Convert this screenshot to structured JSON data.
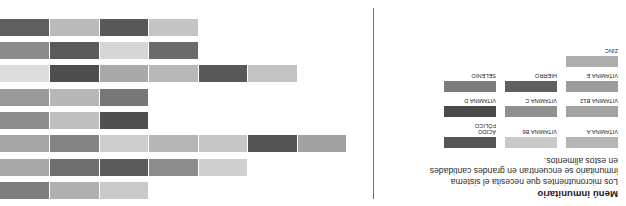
{
  "header": {
    "title": "Menú inmunitario",
    "description": "Los micronutrientes que necesita el sistema inmunitario se encuentran en grandes cantidades en estos alimentos."
  },
  "legend": {
    "rows": [
      [
        {
          "label": "VITAMINA A",
          "color": "#b5b5b5"
        },
        {
          "label": "VITAMINA B6",
          "color": "#c9c9c9"
        },
        {
          "label": "ÁCIDO\nFÓLICO",
          "color": "#555555"
        }
      ],
      [
        {
          "label": "VITAMINA B12",
          "color": "#a3a3a3"
        },
        {
          "label": "VITAMINA C",
          "color": "#8f8f8f"
        },
        {
          "label": "VITAMINA D",
          "color": "#4a4a4a"
        }
      ],
      [
        {
          "label": "VITAMINA E",
          "color": "#9c9c9c"
        },
        {
          "label": "HIERRO",
          "color": "#5f5f5f"
        },
        {
          "label": "SELENIO",
          "color": "#7c7c7c"
        }
      ],
      [
        {
          "label": "ZINC",
          "color": "#adadad"
        }
      ]
    ]
  },
  "chart_data": {
    "type": "bar",
    "orientation": "horizontal-stacked",
    "title": "Menú inmunitario",
    "xlabel": "",
    "ylabel": "",
    "grid": false,
    "legend_position": "left",
    "categories": [
      "ZANAHORIAS",
      "CEREALES",
      "HUEVOS",
      "CÍTRICOS",
      "MARISCOS",
      "AVES",
      "PIMIENTOS",
      "BRÓCOLI"
    ],
    "nutrients": [
      "VITAMINA A",
      "VITAMINA B6",
      "ÁCIDO FÓLICO",
      "VITAMINA B12",
      "VITAMINA C",
      "VITAMINA D",
      "VITAMINA E",
      "HIERRO",
      "SELENIO",
      "ZINC"
    ],
    "series": [
      {
        "category": "ZANAHORIAS",
        "segments": [
          {
            "nutrient": "VITAMINA A",
            "value": 1,
            "color": "#c9c9c9"
          },
          {
            "nutrient": "VITAMINA B6",
            "value": 1,
            "color": "#b0b0b0"
          },
          {
            "nutrient": "VITAMINA E",
            "value": 1,
            "color": "#7e7e7e"
          }
        ]
      },
      {
        "category": "CEREALES",
        "segments": [
          {
            "nutrient": "VITAMINA A",
            "value": 1,
            "color": "#cfcfcf"
          },
          {
            "nutrient": "VITAMINA B6",
            "value": 1,
            "color": "#8c8c8c"
          },
          {
            "nutrient": "ÁCIDO FÓLICO",
            "value": 1,
            "color": "#5c5c5c"
          },
          {
            "nutrient": "HIERRO",
            "value": 1,
            "color": "#6e6e6e"
          },
          {
            "nutrient": "SELENIO",
            "value": 1,
            "color": "#a8a8a8"
          }
        ]
      },
      {
        "category": "HUEVOS",
        "segments": [
          {
            "nutrient": "VITAMINA A",
            "value": 1,
            "color": "#a2a2a2"
          },
          {
            "nutrient": "VITAMINA B12",
            "value": 1,
            "color": "#545454"
          },
          {
            "nutrient": "ÁCIDO FÓLICO",
            "value": 1,
            "color": "#c6c6c6"
          },
          {
            "nutrient": "VITAMINA D",
            "value": 1,
            "color": "#b6b6b6"
          },
          {
            "nutrient": "VITAMINA E",
            "value": 1,
            "color": "#cdcdcd"
          },
          {
            "nutrient": "HIERRO",
            "value": 1,
            "color": "#848484"
          },
          {
            "nutrient": "SELENIO",
            "value": 1,
            "color": "#a5a5a5"
          }
        ]
      },
      {
        "category": "CÍTRICOS",
        "segments": [
          {
            "nutrient": "VITAMINA C",
            "value": 1,
            "color": "#4f4f4f"
          },
          {
            "nutrient": "ÁCIDO FÓLICO",
            "value": 1,
            "color": "#bfbfbf"
          },
          {
            "nutrient": "VITAMINA A",
            "value": 1,
            "color": "#8d8d8d"
          }
        ]
      },
      {
        "category": "MARISCOS",
        "segments": [
          {
            "nutrient": "ZINC",
            "value": 1,
            "color": "#777777"
          },
          {
            "nutrient": "HIERRO",
            "value": 1,
            "color": "#b7b7b7"
          },
          {
            "nutrient": "SELENIO",
            "value": 1,
            "color": "#9a9a9a"
          }
        ]
      },
      {
        "category": "AVES",
        "segments": [
          {
            "nutrient": "VITAMINA A",
            "value": 1,
            "color": "#c2c2c2"
          },
          {
            "nutrient": "VITAMINA B6",
            "value": 1,
            "color": "#585858"
          },
          {
            "nutrient": "ÁCIDO FÓLICO",
            "value": 1,
            "color": "#b8b8b8"
          },
          {
            "nutrient": "VITAMINA B12",
            "value": 1,
            "color": "#a9a9a9"
          },
          {
            "nutrient": "HIERRO",
            "value": 1,
            "color": "#4d4d4d"
          },
          {
            "nutrient": "ZINC",
            "value": 1,
            "color": "#dcdcdc"
          }
        ]
      },
      {
        "category": "PIMIENTOS",
        "segments": [
          {
            "nutrient": "VITAMINA A",
            "value": 1,
            "color": "#6b6b6b"
          },
          {
            "nutrient": "VITAMINA C",
            "value": 1,
            "color": "#d6d6d6"
          },
          {
            "nutrient": "VITAMINA E",
            "value": 1,
            "color": "#5a5a5a"
          },
          {
            "nutrient": "HIERRO",
            "value": 1,
            "color": "#8b8b8b"
          }
        ]
      },
      {
        "category": "BRÓCOLI",
        "segments": [
          {
            "nutrient": "VITAMINA A",
            "value": 1,
            "color": "#c4c4c4"
          },
          {
            "nutrient": "VITAMINA C",
            "value": 1,
            "color": "#585858"
          },
          {
            "nutrient": "ÁCIDO FÓLICO",
            "value": 1,
            "color": "#bababa"
          },
          {
            "nutrient": "HIERRO",
            "value": 1,
            "color": "#5e5e5e"
          }
        ]
      }
    ]
  }
}
